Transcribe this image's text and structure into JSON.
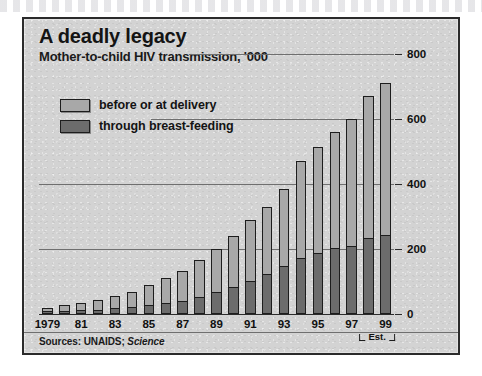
{
  "panel": {
    "title": "A deadly legacy",
    "subtitle": "Mother-to-child HIV transmission, '000",
    "sources_prefix": "Sources: UNAIDS; ",
    "sources_italic": "Science",
    "est_label": "Est.",
    "background_color": "#d3d3d3",
    "border_color": "#2b2b2b"
  },
  "legend": {
    "position": "top-left inside plot",
    "items": [
      {
        "label": "before or at delivery",
        "color": "#a8a8a8",
        "key": "before_or_at_delivery"
      },
      {
        "label": "through breast-feeding",
        "color": "#6c6c6c",
        "key": "through_breast_feeding"
      }
    ]
  },
  "chart_data": {
    "type": "bar",
    "stacked": true,
    "title": "A deadly legacy",
    "subtitle": "Mother-to-child HIV transmission, '000",
    "xlabel": "",
    "ylabel": "",
    "ylim": [
      0,
      800
    ],
    "yticks": [
      0,
      200,
      400,
      600,
      800
    ],
    "ytick_labels": [
      "0",
      "200",
      "400",
      "600",
      "800"
    ],
    "y_axis_side": "right",
    "grid": true,
    "grid_values": [
      200,
      400,
      600,
      800
    ],
    "legend_position": "inside top-left",
    "categories": [
      "1979",
      "1980",
      "1981",
      "1982",
      "1983",
      "1984",
      "1985",
      "1986",
      "1987",
      "1988",
      "1989",
      "1990",
      "1991",
      "1992",
      "1993",
      "1994",
      "1995",
      "1996",
      "1997",
      "1998",
      "1999"
    ],
    "tick_labels": [
      "1979",
      "",
      "81",
      "",
      "83",
      "",
      "85",
      "",
      "87",
      "",
      "89",
      "",
      "91",
      "",
      "93",
      "",
      "95",
      "",
      "97",
      "",
      "99"
    ],
    "series": [
      {
        "name": "through breast-feeding",
        "color": "#6c6c6c",
        "values": [
          4,
          6,
          8,
          10,
          14,
          18,
          24,
          30,
          38,
          50,
          64,
          80,
          100,
          120,
          145,
          170,
          185,
          200,
          205,
          230,
          240
        ]
      },
      {
        "name": "before or at delivery",
        "color": "#a8a8a8",
        "values": [
          16,
          22,
          26,
          32,
          42,
          50,
          66,
          80,
          94,
          115,
          136,
          160,
          190,
          210,
          240,
          300,
          330,
          360,
          395,
          440,
          470
        ]
      }
    ],
    "totals": [
      20,
      28,
      34,
      42,
      56,
      68,
      90,
      110,
      132,
      165,
      200,
      240,
      290,
      330,
      385,
      470,
      515,
      560,
      600,
      670,
      710
    ],
    "annotations": [
      {
        "text": "Est.",
        "applies_to": [
          "1998",
          "1999"
        ]
      }
    ]
  }
}
